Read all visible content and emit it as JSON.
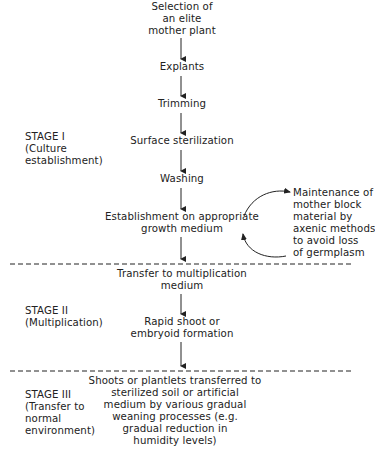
{
  "flowchart": {
    "steps": {
      "selection": [
        "Selection of",
        "an elite",
        "mother plant"
      ],
      "explants": "Explants",
      "trimming": "Trimming",
      "surface_sterilization": "Surface sterilization",
      "washing": "Washing",
      "establishment": [
        "Establishment on appropriate",
        "growth medium"
      ],
      "maintenance": [
        "Maintenance of",
        "mother block",
        "material by",
        "axenic methods",
        "to avoid loss",
        "of germplasm"
      ],
      "transfer_multiplication": [
        "Transfer to multiplication",
        "medium"
      ],
      "rapid_shoot": [
        "Rapid shoot or",
        "embryoid formation"
      ],
      "shoots_transferred": [
        "Shoots or plantlets transferred to",
        "sterilized soil or artificial",
        "medium by various gradual",
        "weaning processes (e.g.",
        "gradual reduction in",
        "humidity levels)"
      ]
    },
    "stages": [
      {
        "title": "STAGE I",
        "desc": [
          "(Culture",
          "establishment)"
        ]
      },
      {
        "title": "STAGE II",
        "desc": [
          "(Multiplication)"
        ]
      },
      {
        "title": "STAGE III",
        "desc": [
          "(Transfer to",
          "normal",
          "environment)"
        ]
      }
    ],
    "colors": {
      "ink": "#222222",
      "background": "#ffffff"
    }
  }
}
